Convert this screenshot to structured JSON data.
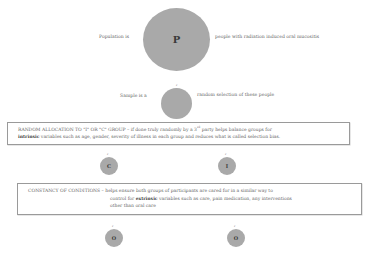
{
  "population": {
    "prefix": "Population is",
    "symbol": "P",
    "suffix": "people with radiation induced oral mucositis"
  },
  "sample": {
    "prefix": "Sample is a",
    "suffix": "random selection of these people",
    "marker": "r"
  },
  "random_allocation": {
    "heading": "RANDOM ALLOCATION TO \"I\" OR \"C\" GROUP",
    "text_line1": " – if done truly randomly by a 3",
    "superscript": "rd",
    "text_line1_end": " party helps balance groups for",
    "bold_word": "intrinsic",
    "text_line2": " variables such as age, gender, severity of illness in each group and reduces what is called selection bias."
  },
  "groups": [
    {
      "symbol": "C",
      "marker": "r"
    },
    {
      "symbol": "I",
      "marker": "r"
    }
  ],
  "constancy": {
    "heading": "CONSTANCY OF CONDITIONS",
    "text_line1": " – helps ensure both groups of participants are cared for in a similar way to",
    "line2_prefix": "control for ",
    "bold_word": "extrinsic",
    "line2_suffix": " variables such as care, pain medication, any interventions",
    "line3": "other than oral care"
  },
  "outcomes": [
    {
      "symbol": "O",
      "marker": "r"
    },
    {
      "symbol": "O",
      "marker": "r"
    }
  ],
  "colors": {
    "circle_fill": "#a9a9a9",
    "box_border": "#9a9a9a",
    "text": "#666666"
  }
}
